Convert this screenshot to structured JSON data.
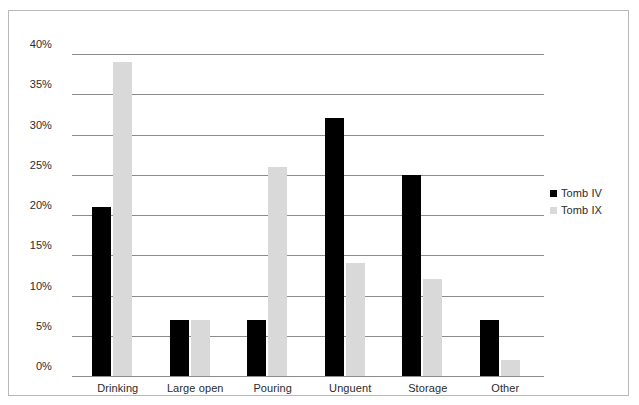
{
  "chart_data": {
    "type": "bar",
    "title": "",
    "subtitle": "",
    "xlabel": "",
    "ylabel": "",
    "categories": [
      "Drinking",
      "Large open",
      "Pouring",
      "Unguent",
      "Storage",
      "Other"
    ],
    "series": [
      {
        "name": "Tomb IV",
        "color": "#000000",
        "values": [
          21,
          7,
          7,
          32,
          25,
          7
        ]
      },
      {
        "name": "Tomb IX",
        "color": "#d9d9d9",
        "values": [
          39,
          7,
          26,
          14,
          12,
          2
        ]
      }
    ],
    "ylim": [
      0,
      40
    ],
    "ytick_step": 5,
    "ytick_labels": [
      "40%",
      "35%",
      "30%",
      "25%",
      "20%",
      "15%",
      "10%",
      "5%",
      "0%"
    ],
    "ytick_values": [
      40,
      35,
      30,
      25,
      20,
      15,
      10,
      5,
      0
    ],
    "value_suffix": "%",
    "grid": true,
    "legend_position": "right"
  },
  "legend": {
    "entries": [
      {
        "label": "Tomb IV",
        "color": "#000000"
      },
      {
        "label": "Tomb IX",
        "color": "#d9d9d9"
      }
    ]
  }
}
